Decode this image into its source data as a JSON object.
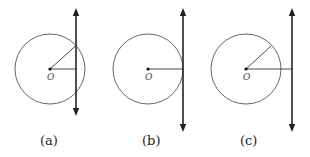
{
  "figure": {
    "center_label": "O",
    "panels": [
      {
        "id": "a",
        "caption": "(a)",
        "relation": "secant",
        "line_intersections": 2
      },
      {
        "id": "b",
        "caption": "(b)",
        "relation": "tangent",
        "line_intersections": 1
      },
      {
        "id": "c",
        "caption": "(c)",
        "relation": "non-intersecting",
        "line_intersections": 0
      }
    ]
  },
  "colors": {
    "stroke": "#333333",
    "line": "#222222",
    "background": "#ffffff"
  }
}
